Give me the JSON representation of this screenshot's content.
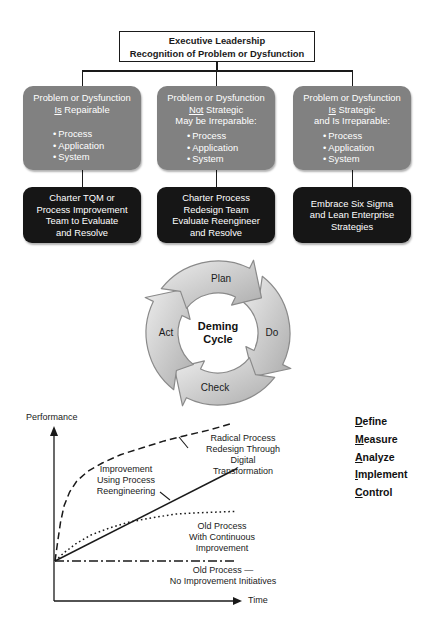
{
  "flowchart": {
    "root": {
      "line1": "Executive Leadership",
      "line2": "Recognition of Problem or Dysfunction"
    },
    "branches": [
      {
        "condition": "Problem or Dysfunction\n__Is__ Repairable",
        "bullets": [
          "Process",
          "Application",
          "System"
        ],
        "action": "Charter TQM or\nProcess Improvement\nTeam to Evaluate\nand Resolve"
      },
      {
        "condition": "Problem or Dysfunction\n__Not__ Strategic\nMay be Irreparable:",
        "bullets": [
          "Process",
          "Application",
          "System"
        ],
        "action": "Charter Process\nRedesign Team\nEvaluate Reengineer\nand Resolve"
      },
      {
        "condition": "Problem or Dysfunction\n__Is__ Strategic\nand Is Irreparable:",
        "bullets": [
          "Process",
          "Application",
          "System"
        ],
        "action": "Embrace Six Sigma\nand Lean Enterprise\nStrategies"
      }
    ]
  },
  "deming_cycle": {
    "center": "Deming\nCycle",
    "steps": [
      "Plan",
      "Do",
      "Check",
      "Act"
    ]
  },
  "dmaic": {
    "items": [
      "Define",
      "Measure",
      "Analyze",
      "Implement",
      "Control"
    ]
  },
  "chart_data": {
    "type": "line",
    "title": "",
    "xlabel": "Time",
    "ylabel": "Performance",
    "grid": false,
    "axes_numeric": false,
    "x_range": [
      0,
      100
    ],
    "y_range": [
      0,
      100
    ],
    "legend_position": "inline-annotations",
    "series": [
      {
        "name": "Radical Process\nRedesign Through Digital\nTransformation",
        "line_style": "dashed",
        "points": [
          [
            0,
            0
          ],
          [
            1.5,
            14
          ],
          [
            3,
            28
          ],
          [
            5,
            40
          ],
          [
            8,
            50
          ],
          [
            12,
            58
          ],
          [
            18,
            65
          ],
          [
            26,
            71
          ],
          [
            36,
            77
          ],
          [
            48,
            82
          ],
          [
            60,
            87
          ],
          [
            72,
            91
          ],
          [
            85,
            95
          ],
          [
            98,
            100
          ]
        ]
      },
      {
        "name": "Improvement\nUsing Process\nReengineering",
        "line_style": "solid",
        "points": [
          [
            0,
            0
          ],
          [
            100,
            67
          ]
        ]
      },
      {
        "name": "Old Process\nWith Continuous Improvement",
        "line_style": "dotted",
        "points": [
          [
            0,
            0
          ],
          [
            5,
            6
          ],
          [
            12,
            13
          ],
          [
            20,
            19
          ],
          [
            30,
            24
          ],
          [
            40,
            28
          ],
          [
            52,
            31
          ],
          [
            66,
            34
          ],
          [
            80,
            35
          ],
          [
            100,
            36
          ]
        ]
      },
      {
        "name": "Old Process —\nNo Improvement Initiatives",
        "line_style": "dashdot",
        "points": [
          [
            0,
            0
          ],
          [
            100,
            0
          ]
        ]
      }
    ]
  },
  "colors": {
    "condition_box": "#818181",
    "action_box": "#161616",
    "box_text": "#ffffff",
    "line": "#1a1a1a",
    "arrow_fill_light": "#e9e9e9",
    "arrow_fill_dark": "#aeaeae",
    "arrow_stroke": "#8a8a8a"
  }
}
